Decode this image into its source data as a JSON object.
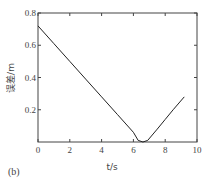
{
  "panel_label": "(b)",
  "chart_data": {
    "type": "line",
    "title": "",
    "xlabel": "t/s",
    "ylabel": "误差/m",
    "xlim": [
      0,
      10
    ],
    "ylim": [
      0,
      0.8
    ],
    "xticks": [
      0,
      2,
      4,
      6,
      8,
      10
    ],
    "yticks": [
      0.2,
      0.4,
      0.6,
      0.8
    ],
    "xtick_labels": [
      "0",
      "2",
      "4",
      "6",
      "8",
      "10"
    ],
    "ytick_labels": [
      "0.2",
      "0.4",
      "0.6",
      "0.8"
    ],
    "grid": false,
    "legend": null,
    "series": [
      {
        "name": "error",
        "x": [
          0,
          1,
          2,
          3,
          4,
          5,
          6,
          6.3,
          6.6,
          6.9,
          7.5,
          8,
          8.5,
          9.2
        ],
        "y": [
          0.72,
          0.61,
          0.5,
          0.39,
          0.28,
          0.17,
          0.06,
          0.01,
          0.0,
          0.01,
          0.08,
          0.14,
          0.2,
          0.28
        ]
      }
    ]
  }
}
